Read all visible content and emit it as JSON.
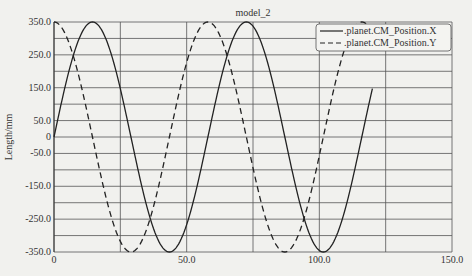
{
  "chart_data": {
    "type": "line",
    "title": "model_2",
    "xlabel": "",
    "ylabel": "Length/mm",
    "xlim": [
      0,
      150
    ],
    "ylim": [
      -350,
      350
    ],
    "grid": true,
    "legend_position": "upper right",
    "x_ticks": [
      "0",
      "50.0",
      "100.0",
      "150.0"
    ],
    "y_ticks": [
      "350.0",
      "250.0",
      "150.0",
      "50.0",
      "0",
      "-50.0",
      "-150.0",
      "-250.0",
      "-350.0"
    ],
    "x_grid_step": 25,
    "y_grid_step": 50,
    "series": [
      {
        "name": ".planet.CM_Position.X",
        "style": "solid",
        "function": "350*sin(2*pi*t/58)",
        "x": [
          0,
          14.5,
          29,
          43.5,
          58,
          72.5,
          87,
          101.5,
          116,
          120
        ],
        "values": [
          0,
          350,
          0,
          -350,
          0,
          350,
          0,
          -350,
          0,
          140
        ]
      },
      {
        "name": ".planet.CM_Position.Y",
        "style": "dashed",
        "function": "350*cos(2*pi*t/58)",
        "x": [
          0,
          14.5,
          29,
          43.5,
          58,
          72.5,
          87,
          101.5,
          116,
          120
        ],
        "values": [
          350,
          0,
          -350,
          0,
          350,
          0,
          -350,
          0,
          350,
          320
        ]
      }
    ]
  }
}
